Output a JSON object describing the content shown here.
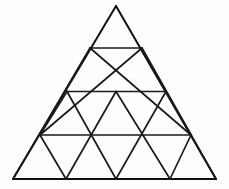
{
  "figure": {
    "title": "Subdivided equilateral triangle",
    "type": "geometric-diagram",
    "background_color": "#fdfdfd",
    "line_color": "#1a1a1a",
    "outline_color": "#111111",
    "rows": 4,
    "small_triangle_count": 16,
    "upward_triangle_count": 10,
    "downward_triangle_count": 6,
    "canvas": {
      "width": 229,
      "height": 189
    },
    "vertices": {
      "apex": {
        "x": 116,
        "y": 6
      },
      "base_left": {
        "x": 13,
        "y": 179
      },
      "base_right": {
        "x": 216,
        "y": 179
      }
    },
    "row_lines": [
      {
        "label": "row-1-base",
        "y": 48,
        "x1": 90,
        "x2": 142
      },
      {
        "label": "row-2-base",
        "y": 91.5,
        "x1": 67,
        "x2": 166
      },
      {
        "label": "row-3-base",
        "y": 135,
        "x1": 40,
        "x2": 191
      },
      {
        "label": "row-4-base",
        "y": 179,
        "x1": 13,
        "x2": 216
      }
    ],
    "lattice": {
      "row_0_points": [
        [
          116,
          6
        ]
      ],
      "row_1_points": [
        [
          90,
          48
        ],
        [
          142,
          48
        ]
      ],
      "row_2_points": [
        [
          67,
          91.5
        ],
        [
          116,
          91.5
        ],
        [
          166,
          91.5
        ]
      ],
      "row_3_points": [
        [
          40,
          135
        ],
        [
          91,
          135
        ],
        [
          141,
          135
        ],
        [
          191,
          135
        ]
      ],
      "row_4_points": [
        [
          13,
          179
        ],
        [
          66,
          179
        ],
        [
          116,
          179
        ],
        [
          170,
          179
        ],
        [
          216,
          179
        ]
      ]
    },
    "left_slanted_lines": [
      {
        "x1": 90,
        "y1": 48,
        "x2": 13,
        "y2": 179
      },
      {
        "x1": 67,
        "y1": 91.5,
        "x2": 40,
        "y2": 135
      },
      {
        "x1": 116,
        "y1": 91.5,
        "x2": 66,
        "y2": 179
      },
      {
        "x1": 142,
        "y1": 48,
        "x2": 40,
        "y2": 135
      },
      {
        "x1": 166,
        "y1": 91.5,
        "x2": 116,
        "y2": 179
      },
      {
        "x1": 191,
        "y1": 135,
        "x2": 170,
        "y2": 179
      }
    ],
    "right_slanted_lines": [
      {
        "x1": 142,
        "y1": 48,
        "x2": 216,
        "y2": 179
      },
      {
        "x1": 90,
        "y1": 48,
        "x2": 191,
        "y2": 135
      },
      {
        "x1": 116,
        "y1": 91.5,
        "x2": 170,
        "y2": 179
      },
      {
        "x1": 67,
        "y1": 91.5,
        "x2": 116,
        "y2": 179
      },
      {
        "x1": 40,
        "y1": 135,
        "x2": 66,
        "y2": 179
      },
      {
        "x1": 166,
        "y1": 91.5,
        "x2": 191,
        "y2": 135
      }
    ]
  }
}
